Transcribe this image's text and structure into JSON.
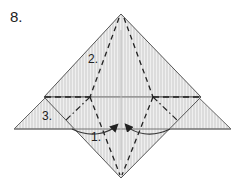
{
  "diagram": {
    "step_number": "8.",
    "labels": {
      "fold_1": "1.",
      "fold_2": "2.",
      "fold_3": "3."
    },
    "colors": {
      "paper_fill": "#d9d9d9",
      "paper_stripe": "#ececec",
      "outline": "#555555",
      "fold_line": "#222222",
      "arrow": "#333333"
    }
  }
}
